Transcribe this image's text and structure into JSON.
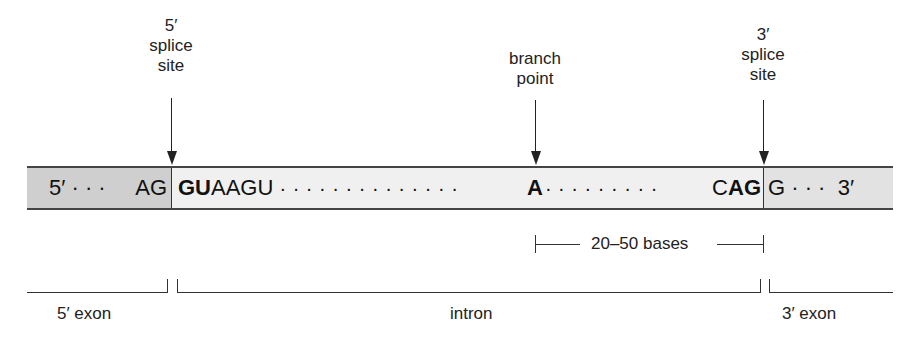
{
  "top_labels": {
    "five_prime_site": {
      "line1": "5′",
      "line2": "splice",
      "line3": "site"
    },
    "branch_point": {
      "line1": "branch",
      "line2": "point"
    },
    "three_prime_site": {
      "line1": "3′",
      "line2": "splice",
      "line3": "site"
    }
  },
  "sequence": {
    "five_prime_exon": {
      "prefix": "5′ · · ·  ",
      "end": "AG",
      "fill_color": "#cfcfcf"
    },
    "intron": {
      "start_bold": "GU",
      "start_rest": "AAGU",
      "dots_before_branch": " · · · · · · · · · · · · · · ",
      "branch_base": "A",
      "dots_after_branch": "· · · · · · · · · ",
      "end_plain": "C",
      "end_bold": "AG",
      "fill_color": "#f0f0f0"
    },
    "three_prime_exon": {
      "start": "G",
      "suffix": " · · ·  3′",
      "fill_color": "#e2e2e2"
    }
  },
  "range": {
    "label": "20–50 bases"
  },
  "regions": {
    "five_prime_exon": "5′ exon",
    "intron": "intron",
    "three_prime_exon": "3′ exon"
  }
}
